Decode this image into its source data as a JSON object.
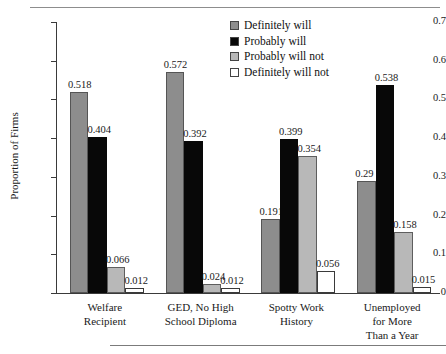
{
  "page": {
    "top_rule": "horizontal-rule",
    "bottom_rule": "horizontal-rule",
    "cropped_header_text": ""
  },
  "legend": {
    "position": "upper-right",
    "items": [
      {
        "label": "Definitely will",
        "color": "#8d8d8d"
      },
      {
        "label": "Probably will",
        "color": "#080808"
      },
      {
        "label": "Probably will not",
        "color": "#b8b8b8"
      },
      {
        "label": "Definitely will not",
        "color": "#ffffff"
      }
    ]
  },
  "axes": {
    "ylabel": "Proportion of Firms",
    "yticks": [
      "0.7",
      "0.6",
      "0.5",
      "0.4",
      "0.3",
      "0.2",
      "0.1",
      "0"
    ],
    "ymin": 0,
    "ymax": 0.7
  },
  "chart_data": {
    "type": "bar",
    "title": "",
    "subtitle": "",
    "xlabel": "",
    "ylabel": "Proportion of Firms",
    "ylim": [
      0,
      0.7
    ],
    "ytick_values": [
      0,
      0.1,
      0.2,
      0.3,
      0.4,
      0.5,
      0.6,
      0.7
    ],
    "grid": false,
    "legend_position": "upper right",
    "categories": [
      "Welfare Recipient",
      "GED, No High School Diploma",
      "Spotty Work History",
      "Unemployed for More Than a Year"
    ],
    "category_lines": [
      [
        "Welfare",
        "Recipient"
      ],
      [
        "GED, No High",
        "School Diploma"
      ],
      [
        "Spotty Work",
        "History"
      ],
      [
        "Unemployed",
        "for More",
        "Than a Year"
      ]
    ],
    "series": [
      {
        "name": "Definitely will",
        "color": "#8d8d8d",
        "values": [
          0.518,
          0.572,
          0.191,
          0.29
        ],
        "labels": [
          "0.518",
          "0.572",
          "0.191",
          "0.29"
        ]
      },
      {
        "name": "Probably will",
        "color": "#080808",
        "values": [
          0.404,
          0.392,
          0.399,
          0.538
        ],
        "labels": [
          "0.404",
          "0.392",
          "0.399",
          "0.538"
        ]
      },
      {
        "name": "Probably will not",
        "color": "#b8b8b8",
        "values": [
          0.066,
          0.024,
          0.354,
          0.158
        ],
        "labels": [
          "0.066",
          "0.024",
          "0.354",
          "0.158"
        ]
      },
      {
        "name": "Definitely will not",
        "color": "#ffffff",
        "values": [
          0.012,
          0.012,
          0.056,
          0.015
        ],
        "labels": [
          "0.012",
          "0.012",
          "0.056",
          "0.015"
        ]
      }
    ]
  }
}
